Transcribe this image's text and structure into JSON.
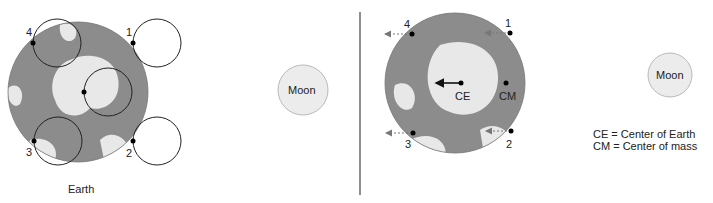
{
  "left_panel": {
    "earth_label": "Earth",
    "moon_label": "Moon",
    "points": [
      {
        "label": "1"
      },
      {
        "label": "2"
      },
      {
        "label": "3"
      },
      {
        "label": "4"
      }
    ]
  },
  "right_panel": {
    "moon_label": "Moon",
    "center_earth_label": "CE",
    "center_mass_label": "CM",
    "points": [
      {
        "label": "1"
      },
      {
        "label": "2"
      },
      {
        "label": "3"
      },
      {
        "label": "4"
      }
    ]
  },
  "legend": {
    "line1": "CE = Center of Earth",
    "line2": "CM = Center of mass"
  },
  "colors": {
    "earth_ocean": "#8c8c8c",
    "earth_land": "#e6e6e6",
    "moon": "#ececec",
    "arrow": "#777777",
    "divider": "#444444"
  }
}
